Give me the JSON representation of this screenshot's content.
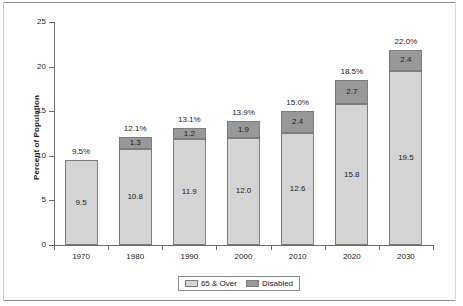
{
  "chart_data": {
    "type": "bar",
    "stacked": true,
    "title": "",
    "xlabel": "",
    "ylabel": "Percent of Population",
    "ylim": [
      0,
      25
    ],
    "yticks": [
      0,
      5,
      10,
      15,
      20,
      25
    ],
    "ytick_labels": [
      "0",
      "5",
      "10",
      "15",
      "20",
      "25"
    ],
    "grid": false,
    "legend_position": "bottom-center",
    "categories": [
      "1970",
      "1980",
      "1990",
      "2000",
      "2010",
      "2020",
      "2030"
    ],
    "series": [
      {
        "name": "65 & Over",
        "color": "#d4d4d4",
        "values": [
          9.5,
          10.8,
          11.9,
          12.0,
          12.6,
          15.8,
          19.5
        ],
        "labels": [
          "9.5",
          "10.8",
          "11.9",
          "12.0",
          "12.6",
          "15.8",
          "19.5"
        ]
      },
      {
        "name": "Disabled",
        "color": "#989898",
        "values": [
          0,
          1.3,
          1.2,
          1.9,
          2.4,
          2.7,
          2.4
        ],
        "labels": [
          "",
          "1.3",
          "1.2",
          "1.9",
          "2.4",
          "2.7",
          "2.4"
        ]
      }
    ],
    "total_labels": [
      "9.5%",
      "12.1%",
      "13.1%",
      "13.9%",
      "15.0%",
      "18.5%",
      "22.0%"
    ],
    "totals": [
      9.5,
      12.1,
      13.1,
      13.9,
      15.0,
      18.5,
      22.0
    ]
  },
  "legend": {
    "items": [
      {
        "label": "65 & Over",
        "color": "#d4d4d4"
      },
      {
        "label": "Disabled",
        "color": "#989898"
      }
    ]
  }
}
